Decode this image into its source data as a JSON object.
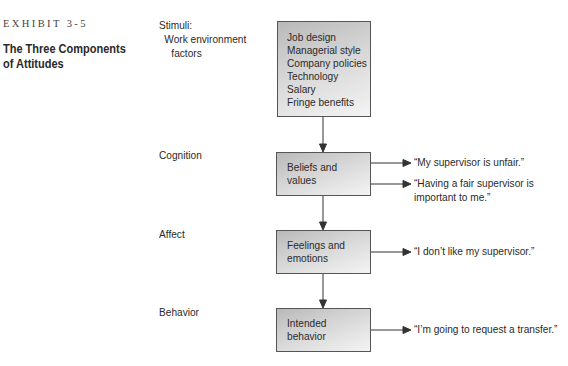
{
  "exhibit": {
    "number": "EXHIBIT 3-5",
    "title": "The Three Components of Attitudes",
    "title_lines": [
      "The Three Components",
      "of Attitudes"
    ]
  },
  "diagram": {
    "stages": [
      {
        "label_lines": [
          "Stimuli:",
          "Work environment",
          "factors"
        ],
        "box_lines": [
          "Job design",
          "Managerial style",
          "Company policies",
          "Technology",
          "Salary",
          "Fringe benefits"
        ],
        "outcomes": []
      },
      {
        "label_lines": [
          "Cognition"
        ],
        "box_lines": [
          "Beliefs and",
          "values"
        ],
        "outcomes": [
          {
            "lines": [
              "“My supervisor is unfair.”"
            ]
          },
          {
            "lines": [
              "“Having a fair supervisor is",
              "important to me.”"
            ]
          }
        ]
      },
      {
        "label_lines": [
          "Affect"
        ],
        "box_lines": [
          "Feelings and",
          "emotions"
        ],
        "outcomes": [
          {
            "lines": [
              "“I don’t like my supervisor.”"
            ]
          }
        ]
      },
      {
        "label_lines": [
          "Behavior"
        ],
        "box_lines": [
          "Intended",
          "behavior"
        ],
        "outcomes": [
          {
            "lines": [
              "“I’m going to request a transfer.”"
            ]
          }
        ]
      }
    ],
    "colors": {
      "box_border": "#555555",
      "box_gradient_dark": "#b9b9b9",
      "box_gradient_light": "#f4f4f4",
      "arrow": "#333333",
      "text": "#2a2a2a"
    }
  }
}
